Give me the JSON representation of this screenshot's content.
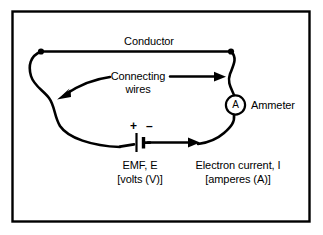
{
  "figure": {
    "kind": "electrical-circuit-diagram",
    "border_color": "#000000",
    "line_color": "#000000",
    "background_color": "#ffffff"
  },
  "labels": {
    "conductor": "Conductor",
    "connecting_wires_line1": "Connecting",
    "connecting_wires_line2": "wires",
    "ammeter": "Ammeter",
    "ammeter_symbol": "A",
    "emf_line1": "EMF, E",
    "emf_line2": "[volts (V)]",
    "current_line1": "Electron current, I",
    "current_line2": "[amperes (A)]",
    "battery_positive": "+",
    "battery_negative": "–"
  },
  "components": {
    "battery": {
      "name": "battery-emf-source",
      "positive_side": "left",
      "negative_side": "right"
    },
    "ammeter": {
      "name": "ammeter-meter",
      "symbol": "A",
      "shape": "circle"
    },
    "nodes": [
      {
        "name": "junction-top-left"
      },
      {
        "name": "junction-top-right"
      }
    ]
  },
  "annotations": {
    "current_direction": "clockwise-right-along-bottom",
    "leader_arrows": [
      {
        "name": "arrow-to-left-wire",
        "points_to": "left-connecting-wire"
      },
      {
        "name": "arrow-to-right-wire",
        "points_to": "right-connecting-wire"
      },
      {
        "name": "arrow-electron-current",
        "points_to": "bottom-wire-right"
      }
    ]
  }
}
